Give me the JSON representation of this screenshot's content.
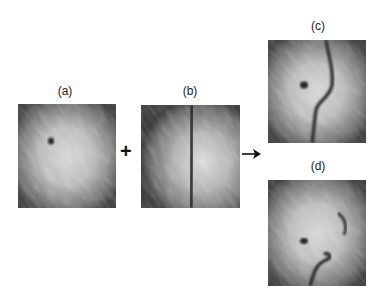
{
  "figure": {
    "panels": [
      {
        "id": "a",
        "label": "(a)",
        "description": "speckled circular field with a single dark spot upper-left of center"
      },
      {
        "id": "b",
        "label": "(b)",
        "description": "speckled circular field with a vertical dark line down the middle"
      },
      {
        "id": "c",
        "label": "(c)",
        "description": "speckled field with dark spot and an S-shaped curved dark line"
      },
      {
        "id": "d",
        "label": "(d)",
        "description": "speckled field with dark spot and a curved dark feature in lower right"
      }
    ],
    "operators": {
      "plus": "+",
      "arrow": "→"
    }
  }
}
